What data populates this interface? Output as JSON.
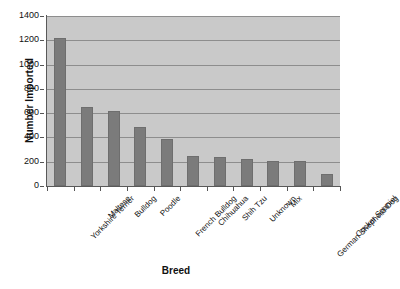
{
  "chart_data": {
    "type": "bar",
    "title": "",
    "xlabel": "Breed",
    "ylabel": "Number Imported",
    "categories": [
      "Yorkshire Terrier",
      "Maltese",
      "Bulldog",
      "Poodle",
      "French Bulldog",
      "Chihuahua",
      "Shih Tzu",
      "Unknown",
      "Mix",
      "German Shepherd Dog",
      "Cocker Spaniel"
    ],
    "values": [
      1220,
      650,
      620,
      490,
      385,
      250,
      235,
      220,
      210,
      205,
      95
    ],
    "ylim": [
      0,
      1400
    ],
    "yticks": [
      0,
      200,
      400,
      600,
      800,
      1000,
      1200,
      1400
    ],
    "ytick_labels": [
      "0",
      "200",
      "400",
      "600",
      "800",
      "1000",
      "1200",
      "1400"
    ],
    "grid": true,
    "legend": "none",
    "bar_color": "#7b7b7b",
    "plot_background": "#c9c9c9",
    "gridline_color": "#8d8d8d",
    "axis_color": "#595959",
    "page_background": "#ffffff"
  }
}
